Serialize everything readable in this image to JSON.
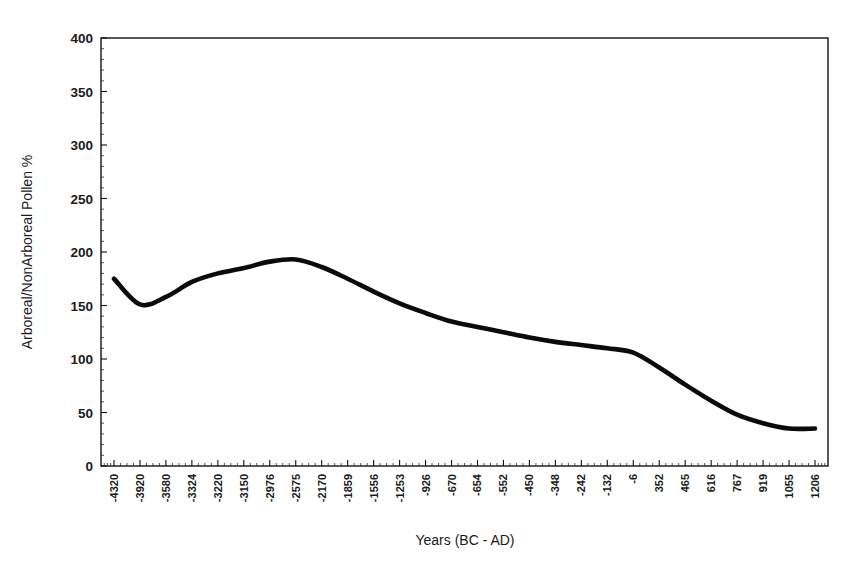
{
  "chart_data": {
    "type": "line",
    "title": "",
    "xlabel": "Years (BC - AD)",
    "ylabel": "Arboreal/NonArboreal Pollen %",
    "grid": false,
    "legend": false,
    "ylim": [
      0,
      400
    ],
    "yticks": [
      0,
      50,
      100,
      150,
      200,
      250,
      300,
      350,
      400
    ],
    "ytick_labels": [
      "0",
      "50",
      "100",
      "150",
      "200",
      "250",
      "300",
      "350",
      "400"
    ],
    "categories": [
      "-4320",
      "-3920",
      "-3580",
      "-3324",
      "-3220",
      "-3150",
      "-2976",
      "-2575",
      "-2170",
      "-1859",
      "-1556",
      "-1253",
      "-926",
      "-670",
      "-654",
      "-552",
      "-450",
      "-348",
      "-242",
      "-132",
      "-6",
      "352",
      "465",
      "616",
      "767",
      "919",
      "1055",
      "1206"
    ],
    "values": [
      175,
      151,
      158,
      172,
      180,
      185,
      191,
      193,
      186,
      175,
      163,
      152,
      143,
      135,
      130,
      125,
      120,
      116,
      113,
      110,
      106,
      92,
      76,
      61,
      48,
      40,
      35,
      35
    ],
    "series": [
      {
        "name": "Arboreal/NonArboreal Pollen %",
        "color": "#0b0b0b",
        "values": [
          175,
          151,
          158,
          172,
          180,
          185,
          191,
          193,
          186,
          175,
          163,
          152,
          143,
          135,
          130,
          125,
          120,
          116,
          113,
          110,
          106,
          92,
          76,
          61,
          48,
          40,
          35,
          35
        ]
      }
    ],
    "axis_color": "#121212",
    "background": "#ffffff"
  },
  "figure": {
    "plot_left_px": 101,
    "plot_top_px": 38,
    "plot_right_px": 828,
    "plot_bottom_px": 466
  }
}
